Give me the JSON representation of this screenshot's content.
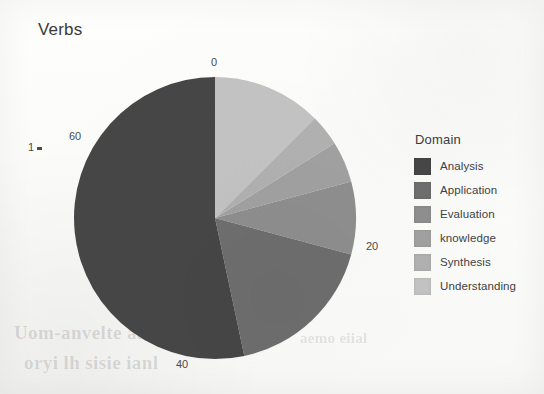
{
  "chart_title": "Verbs",
  "legend": {
    "title": "Domain",
    "items": [
      {
        "label": "Analysis",
        "color": "#464646"
      },
      {
        "label": "Application",
        "color": "#6e6e6e"
      },
      {
        "label": "Evaluation",
        "color": "#8e8e8e"
      },
      {
        "label": "knowledge",
        "color": "#a0a0a0"
      },
      {
        "label": "Synthesis",
        "color": "#b0b0b0"
      },
      {
        "label": "Understanding",
        "color": "#c2c2c2"
      }
    ]
  },
  "axis": {
    "ticks": [
      {
        "label": "0"
      },
      {
        "label": "20"
      },
      {
        "label": "40"
      },
      {
        "label": "60"
      }
    ],
    "stub_label": "1"
  },
  "bleed_through": {
    "line1": "Uom-anvelte aaaglia",
    "line2": "oryi lh sisie ianl",
    "line3": "aemo eiial"
  },
  "chart_data": {
    "type": "pie",
    "title": "Verbs",
    "legend_title": "Domain",
    "legend_position": "right",
    "units": "count",
    "total": 72,
    "axis_type": "polar-count",
    "axis_ticks": [
      0,
      20,
      40,
      60
    ],
    "axis_range": [
      0,
      72
    ],
    "start_angle_deg": 0,
    "direction": "clockwise",
    "categories": [
      "Understanding",
      "Synthesis",
      "knowledge",
      "Evaluation",
      "Application",
      "Analysis"
    ],
    "values": [
      9,
      2.6,
      3.4,
      6,
      12.6,
      38.4
    ],
    "percentages": [
      12.5,
      3.6,
      4.7,
      8.3,
      17.5,
      53.4
    ],
    "colors": [
      "#c2c2c2",
      "#b0b0b0",
      "#a0a0a0",
      "#8e8e8e",
      "#6e6e6e",
      "#464646"
    ],
    "slices": [
      {
        "name": "Understanding",
        "value": 9,
        "percent": 12.5,
        "start_deg": 0,
        "end_deg": 45,
        "color": "#c2c2c2"
      },
      {
        "name": "Synthesis",
        "value": 2.6,
        "percent": 3.6,
        "start_deg": 45,
        "end_deg": 58,
        "color": "#b0b0b0"
      },
      {
        "name": "knowledge",
        "value": 3.4,
        "percent": 4.7,
        "start_deg": 58,
        "end_deg": 75,
        "color": "#a0a0a0"
      },
      {
        "name": "Evaluation",
        "value": 6,
        "percent": 8.3,
        "start_deg": 75,
        "end_deg": 105,
        "color": "#8e8e8e"
      },
      {
        "name": "Application",
        "value": 12.6,
        "percent": 17.5,
        "start_deg": 105,
        "end_deg": 168,
        "color": "#6e6e6e"
      },
      {
        "name": "Analysis",
        "value": 38.4,
        "percent": 53.4,
        "start_deg": 168,
        "end_deg": 360,
        "color": "#464646"
      }
    ],
    "grid": false,
    "xlabel": "",
    "ylabel": ""
  }
}
